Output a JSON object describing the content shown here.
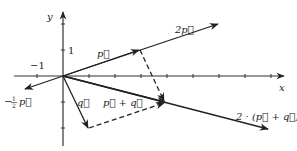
{
  "diagram": {
    "axes": {
      "x_label": "x",
      "y_label": "y",
      "x_tick_label": "−1",
      "y_tick_label": "1",
      "origin_px": [
        63,
        76
      ],
      "unit_px": 26
    },
    "vectors": [
      {
        "id": "p",
        "label": "p⃗",
        "from": [
          0,
          0
        ],
        "to": [
          2.9,
          1
        ],
        "style": "solid"
      },
      {
        "id": "2p",
        "label": "2p⃗",
        "from": [
          0,
          0
        ],
        "to": [
          5.9,
          2
        ],
        "style": "solid"
      },
      {
        "id": "minus-half-p",
        "label": "−½p⃗",
        "from": [
          0,
          0
        ],
        "to": [
          -1.45,
          -0.5
        ],
        "style": "solid"
      },
      {
        "id": "q",
        "label": "q⃗",
        "from": [
          0,
          0
        ],
        "to": [
          1,
          -2
        ],
        "style": "solid"
      },
      {
        "id": "p-plus-q",
        "label": "p⃗ + q⃗",
        "from": [
          0,
          0
        ],
        "to": [
          3.9,
          -1
        ],
        "style": "solid"
      },
      {
        "id": "2-p-plus-q",
        "label": "2 · (p⃗ + q⃗)",
        "from": [
          0,
          0
        ],
        "to": [
          7.8,
          -2
        ],
        "style": "solid"
      },
      {
        "id": "p-translated",
        "label": "",
        "from": [
          1,
          -2
        ],
        "to": [
          3.9,
          -1
        ],
        "style": "dashed"
      },
      {
        "id": "q-translated",
        "label": "",
        "from": [
          2.9,
          1
        ],
        "to": [
          3.9,
          -1
        ],
        "style": "dashed"
      }
    ],
    "labels": {
      "p": "p⃗",
      "two_p": "2p⃗",
      "minus_half_p_prefix": "−",
      "minus_half_p_num": "1",
      "minus_half_p_den": "2",
      "minus_half_p_var": "p⃗",
      "q": "q⃗",
      "p_plus_q": "p⃗ + q⃗",
      "two_p_plus_q": "2 · (p⃗ + q⃗)"
    }
  }
}
